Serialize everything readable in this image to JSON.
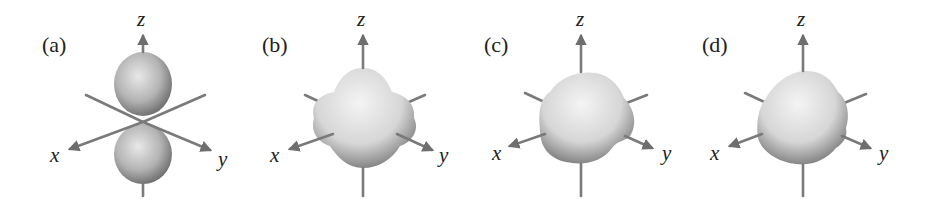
{
  "figure": {
    "panels": [
      {
        "id": "a",
        "label": "(a)",
        "shape": "dumbbell (two lobes along z)",
        "axes": {
          "x": "x",
          "y": "y",
          "z": "z"
        }
      },
      {
        "id": "b",
        "label": "(b)",
        "shape": "cloverleaf / four-lobed rounded body",
        "axes": {
          "x": "x",
          "y": "y",
          "z": "z"
        }
      },
      {
        "id": "c",
        "label": "(c)",
        "shape": "rounded tetrahedral-like body",
        "axes": {
          "x": "x",
          "y": "y",
          "z": "z"
        }
      },
      {
        "id": "d",
        "label": "(d)",
        "shape": "rounded irregular body",
        "axes": {
          "x": "x",
          "y": "y",
          "z": "z"
        }
      }
    ],
    "colors": {
      "background": "#ffffff",
      "axis": "#7a7a7a",
      "surface_light": "#eeeeee",
      "surface_dark": "#555555",
      "text": "#222222"
    }
  }
}
